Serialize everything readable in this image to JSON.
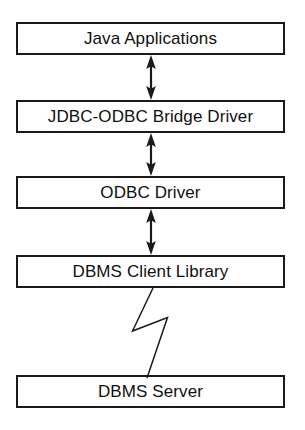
{
  "diagram": {
    "background_color": "#ffffff",
    "stroke_color": "#1a1a1a",
    "text_color": "#101010",
    "layers": [
      {
        "id": "java-applications",
        "label": "Java Applications"
      },
      {
        "id": "jdbc-odbc-bridge",
        "label": "JDBC-ODBC Bridge Driver"
      },
      {
        "id": "odbc-driver",
        "label": "ODBC Driver"
      },
      {
        "id": "dbms-client-library",
        "label": "DBMS Client Library"
      },
      {
        "id": "dbms-server",
        "label": "DBMS Server"
      }
    ],
    "connectors": [
      {
        "id": "arrow-java-bridge",
        "type": "double-headed-arrow",
        "from": "java-applications",
        "to": "jdbc-odbc-bridge"
      },
      {
        "id": "arrow-bridge-odbc",
        "type": "double-headed-arrow",
        "from": "jdbc-odbc-bridge",
        "to": "odbc-driver"
      },
      {
        "id": "arrow-odbc-client",
        "type": "double-headed-arrow",
        "from": "odbc-driver",
        "to": "dbms-client-library"
      },
      {
        "id": "bolt-client-server",
        "type": "lightning-bolt",
        "from": "dbms-client-library",
        "to": "dbms-server"
      }
    ]
  }
}
